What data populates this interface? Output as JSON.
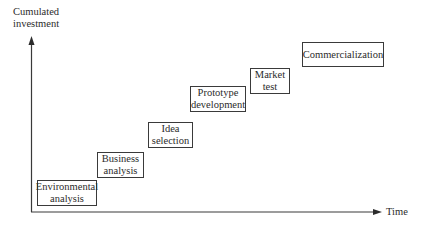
{
  "diagram": {
    "type": "staircase-process",
    "y_axis_label": "Cumulated\ninvestment",
    "x_axis_label": "Time",
    "stages": [
      {
        "label": "Environmental\nanalysis"
      },
      {
        "label": "Business\nanalysis"
      },
      {
        "label": "Idea\nselection"
      },
      {
        "label": "Prototype\ndevelopment"
      },
      {
        "label": "Market\ntest"
      },
      {
        "label": "Commercialization"
      }
    ],
    "colors": {
      "line": "#3a3a3a",
      "text": "#2b2b2b",
      "background": "#ffffff"
    }
  }
}
